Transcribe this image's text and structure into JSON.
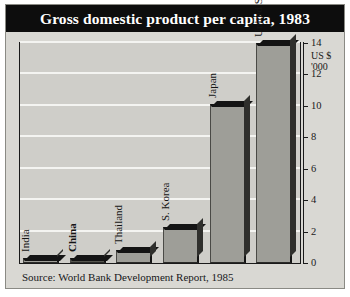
{
  "figure": {
    "title": "Gross domestic product per capita, 1983",
    "source": "Source: World Bank Development Report, 1985",
    "unit_line1": "US $",
    "unit_line2": "'000",
    "colors": {
      "title_bar_bg": "#0d0d0d",
      "title_text": "#ffffff",
      "panel_bg": "#d9d8d3",
      "plot_bg": "#cfcec9",
      "gridline": "#f4f4f1",
      "bar_fill": "#9e9e98",
      "bar_fill_dark": "#56564f",
      "bar_edge": "#141414",
      "axis": "#1a1a1a"
    }
  },
  "chart_data": {
    "type": "bar",
    "title": "Gross domestic product per capita, 1983",
    "xlabel": "",
    "ylabel": "US $ '000",
    "ylim": [
      0,
      14
    ],
    "yticks": [
      0,
      2,
      4,
      6,
      8,
      10,
      12,
      14
    ],
    "ytick_labels": [
      "0",
      "2",
      "4",
      "6",
      "8",
      "10",
      "12",
      "14"
    ],
    "grid": true,
    "legend": "none",
    "categories": [
      "India",
      "China",
      "Thailand",
      "S. Korea",
      "Japan",
      "United States"
    ],
    "values": [
      0.3,
      0.3,
      0.8,
      2.3,
      10.1,
      14.0
    ],
    "bar_styles": [
      "light",
      "dark",
      "light",
      "light",
      "light",
      "light"
    ],
    "label_bold": [
      false,
      true,
      false,
      false,
      false,
      false
    ]
  }
}
